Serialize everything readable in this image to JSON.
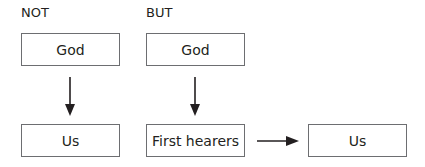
{
  "columns": {
    "not": {
      "heading": "NOT",
      "top_box": "God",
      "bottom_box": "Us"
    },
    "but": {
      "heading": "BUT",
      "top_box": "God",
      "bottom_box": "First hearers",
      "right_box": "Us"
    }
  },
  "colors": {
    "box_border": "#6d6e71",
    "text": "#231f20",
    "arrow": "#231f20"
  }
}
